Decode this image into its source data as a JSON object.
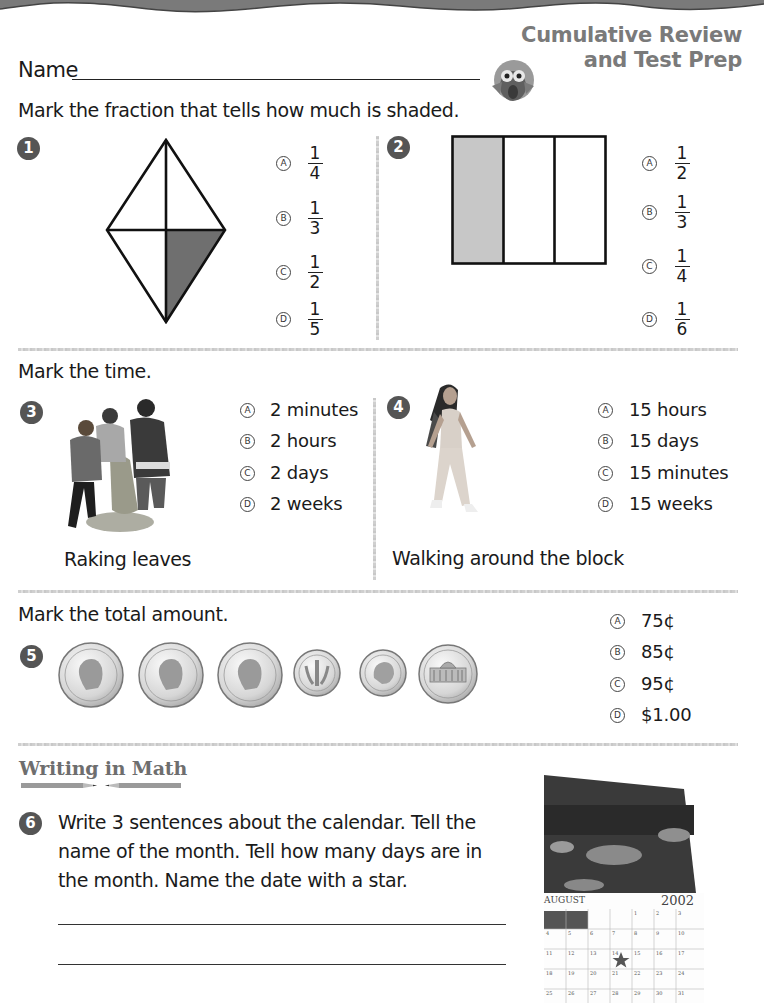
{
  "header": {
    "name_label": "Name",
    "title_line1": "Cumulative Review",
    "title_line2": "and Test Prep",
    "mascot_icon": "owl-icon"
  },
  "section_fractions": {
    "instruction": "Mark the fraction that tells how much is shaded.",
    "questions": [
      {
        "number": "1",
        "figure": "kite divided into 4 parts, 1 shaded",
        "options": [
          {
            "letter": "A",
            "numerator": "1",
            "denominator": "4"
          },
          {
            "letter": "B",
            "numerator": "1",
            "denominator": "3"
          },
          {
            "letter": "C",
            "numerator": "1",
            "denominator": "2"
          },
          {
            "letter": "D",
            "numerator": "1",
            "denominator": "5"
          }
        ]
      },
      {
        "number": "2",
        "figure": "rectangle divided into 3 parts, 1 shaded",
        "options": [
          {
            "letter": "A",
            "numerator": "1",
            "denominator": "2"
          },
          {
            "letter": "B",
            "numerator": "1",
            "denominator": "3"
          },
          {
            "letter": "C",
            "numerator": "1",
            "denominator": "4"
          },
          {
            "letter": "D",
            "numerator": "1",
            "denominator": "6"
          }
        ]
      }
    ]
  },
  "section_time": {
    "instruction": "Mark the time.",
    "questions": [
      {
        "number": "3",
        "caption": "Raking leaves",
        "options": [
          {
            "letter": "A",
            "text": "2 minutes"
          },
          {
            "letter": "B",
            "text": "2 hours"
          },
          {
            "letter": "C",
            "text": "2 days"
          },
          {
            "letter": "D",
            "text": "2 weeks"
          }
        ]
      },
      {
        "number": "4",
        "caption": "Walking around the block",
        "options": [
          {
            "letter": "A",
            "text": "15 hours"
          },
          {
            "letter": "B",
            "text": "15 days"
          },
          {
            "letter": "C",
            "text": "15 minutes"
          },
          {
            "letter": "D",
            "text": "15 weeks"
          }
        ]
      }
    ]
  },
  "section_money": {
    "instruction": "Mark the total amount.",
    "number": "5",
    "coins": [
      "quarter",
      "quarter",
      "quarter",
      "dime",
      "dime",
      "nickel"
    ],
    "options": [
      {
        "letter": "A",
        "text": "75¢"
      },
      {
        "letter": "B",
        "text": "85¢"
      },
      {
        "letter": "C",
        "text": "95¢"
      },
      {
        "letter": "D",
        "text": "$1.00"
      }
    ]
  },
  "section_writing": {
    "title": "Writing in Math",
    "number": "6",
    "prompt": "Write 3 sentences about the calendar. Tell the name of the month. Tell how many days are in the month. Name the date with a star.",
    "calendar": {
      "month": "AUGUST",
      "year": "2002",
      "rows": [
        [
          "",
          "",
          "",
          "",
          "1",
          "2",
          "3"
        ],
        [
          "4",
          "5",
          "6",
          "7",
          "8",
          "9",
          "10"
        ],
        [
          "11",
          "12",
          "13",
          "14",
          "15",
          "16",
          "17"
        ],
        [
          "18",
          "19",
          "20",
          "21",
          "22",
          "23",
          "24"
        ],
        [
          "25",
          "26",
          "27",
          "28",
          "29",
          "30",
          "31"
        ]
      ],
      "starred_date": "14"
    }
  }
}
